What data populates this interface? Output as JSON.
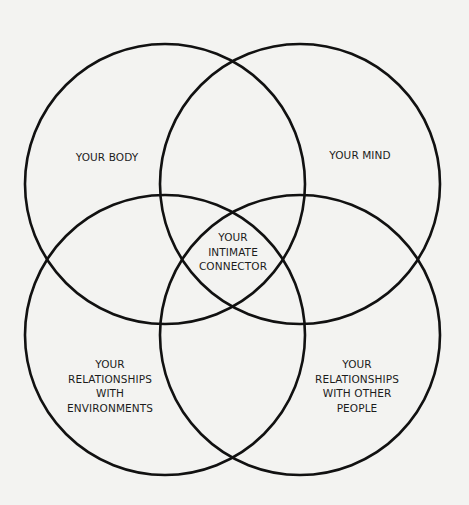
{
  "diagram": {
    "type": "venn",
    "background": "#f3f3f1",
    "stroke_color": "#111111",
    "stroke_width": 2.6,
    "circles": [
      {
        "name": "body",
        "cx": 165,
        "cy": 184,
        "r": 140
      },
      {
        "name": "mind",
        "cx": 300,
        "cy": 184,
        "r": 140
      },
      {
        "name": "environments",
        "cx": 165,
        "cy": 335,
        "r": 140
      },
      {
        "name": "other-people",
        "cx": 300,
        "cy": 335,
        "r": 140
      }
    ],
    "labels": {
      "body": {
        "lines": [
          "YOUR BODY"
        ]
      },
      "mind": {
        "lines": [
          "YOUR MIND"
        ]
      },
      "center": {
        "lines": [
          "YOUR",
          "INTIMATE",
          "CONNECTOR"
        ]
      },
      "environments": {
        "lines": [
          "YOUR",
          "RELATIONSHIPS",
          "WITH",
          "ENVIRONMENTS"
        ]
      },
      "other_people": {
        "lines": [
          "YOUR",
          "RELATIONSHIPS",
          "WITH OTHER",
          "PEOPLE"
        ]
      }
    }
  }
}
